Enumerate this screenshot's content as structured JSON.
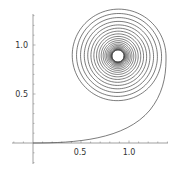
{
  "chart_data": {
    "type": "line",
    "title": "",
    "xlabel": "",
    "ylabel": "",
    "x_ticks": [
      "0.5",
      "1.0"
    ],
    "y_ticks": [
      "0.5",
      "1.0"
    ],
    "xlim": [
      -0.22,
      1.41
    ],
    "ylim": [
      -0.2,
      1.3
    ],
    "grid": false,
    "legend": null,
    "spiral_center": [
      0.885,
      0.89
    ],
    "curve_extents": {
      "x_max": 1.38,
      "y_max": 1.27
    },
    "series": [
      {
        "name": "spiral",
        "color": "#444444"
      }
    ]
  },
  "plot": {
    "x_tick_labels": [
      "0.5",
      "1.0"
    ],
    "y_tick_labels": [
      "0.5",
      "1.0"
    ]
  }
}
